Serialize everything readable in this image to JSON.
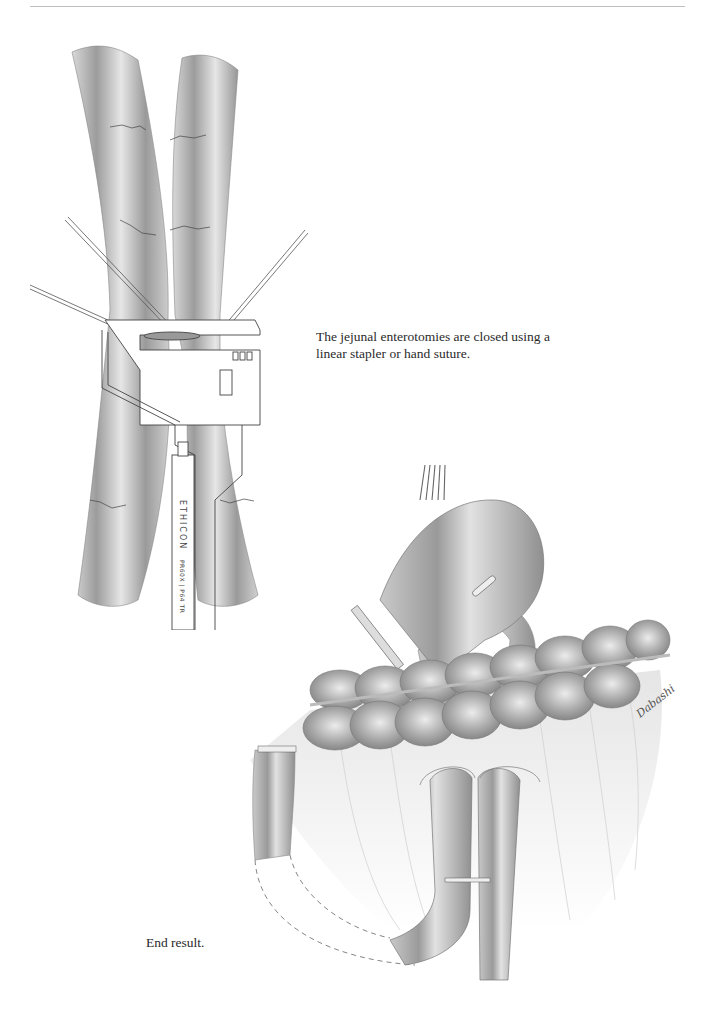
{
  "page": {
    "header_rule": true
  },
  "figures": [
    {
      "id": "figure-1",
      "subject": "stapler-closing-jejunal-enterotomies",
      "caption": "The jejunal enterotomies are closed using a linear stapler or hand suture.",
      "stapler_label": "ETHICON",
      "stapler_model": "PR60X | P64 TR"
    },
    {
      "id": "figure-2",
      "subject": "end-result-reconstruction",
      "caption": "End result.",
      "signature": "Dabashi"
    }
  ],
  "colors": {
    "bowel_fill": "#a9a9a9",
    "bowel_highlight": "#e8e8e8",
    "line": "#555555",
    "text": "#2a2a2a"
  }
}
